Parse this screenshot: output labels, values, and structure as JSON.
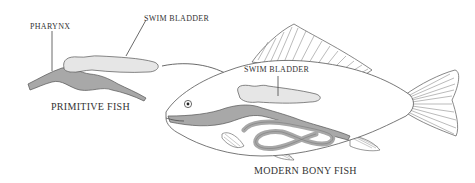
{
  "diagram": {
    "type": "anatomical-comparison",
    "colors": {
      "outline": "#555555",
      "gut_fill": "#a8a8a8",
      "bladder_fill": "#e6e6e6",
      "background": "#ffffff",
      "text": "#333333"
    },
    "primitive_fish": {
      "title": "PRIMITIVE FISH",
      "labels": {
        "pharynx": "PHARYNX",
        "swim_bladder": "SWIM BLADDER"
      }
    },
    "modern_fish": {
      "title": "MODERN BONY FISH",
      "labels": {
        "swim_bladder": "SWIM BLADDER"
      }
    },
    "connector": "arrow from primitive swim bladder to modern swim bladder"
  }
}
